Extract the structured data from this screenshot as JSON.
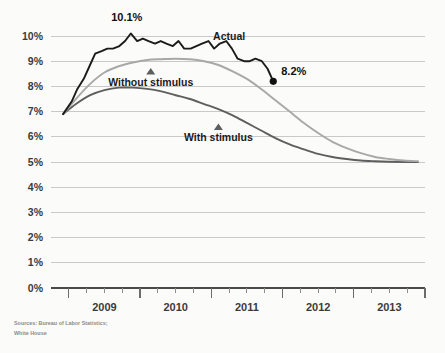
{
  "chart_data": {
    "type": "line",
    "title": "",
    "subtitle": "",
    "xlabel": "",
    "ylabel": "",
    "ylim": [
      0,
      10.5
    ],
    "xlim": [
      2008.75,
      2014.0
    ],
    "grid": true,
    "legend_position": "inline-annotations",
    "ytick_labels": [
      "0%",
      "1%",
      "2%",
      "3%",
      "4%",
      "5%",
      "6%",
      "7%",
      "8%",
      "9%",
      "10%"
    ],
    "ytick_values": [
      0,
      1,
      2,
      3,
      4,
      5,
      6,
      7,
      8,
      9,
      10
    ],
    "xtick_labels": [
      "2009",
      "2010",
      "2011",
      "2012",
      "2013"
    ],
    "xtick_values": [
      2009.5,
      2010.5,
      2011.5,
      2012.5,
      2013.5
    ],
    "x_minor_ticks_per_year": 4,
    "series": [
      {
        "name": "Actual",
        "color": "#1b1b1b",
        "x": [
          2008.92,
          2009.04,
          2009.12,
          2009.21,
          2009.29,
          2009.37,
          2009.46,
          2009.54,
          2009.62,
          2009.71,
          2009.79,
          2009.87,
          2009.96,
          2010.04,
          2010.12,
          2010.21,
          2010.29,
          2010.37,
          2010.46,
          2010.54,
          2010.62,
          2010.71,
          2010.79,
          2010.87,
          2010.96,
          2011.04,
          2011.12,
          2011.21,
          2011.29,
          2011.37,
          2011.46,
          2011.54,
          2011.62,
          2011.71,
          2011.79,
          2011.87
        ],
        "values": [
          6.9,
          7.4,
          7.9,
          8.3,
          8.8,
          9.3,
          9.4,
          9.5,
          9.5,
          9.6,
          9.8,
          10.1,
          9.8,
          9.9,
          9.8,
          9.7,
          9.8,
          9.7,
          9.6,
          9.8,
          9.5,
          9.5,
          9.6,
          9.7,
          9.8,
          9.5,
          9.7,
          9.8,
          9.5,
          9.1,
          9.0,
          9.0,
          9.1,
          9.0,
          8.7,
          8.2
        ]
      },
      {
        "name": "Without stimulus",
        "color": "#a8a8a8",
        "x": [
          2008.92,
          2009.1,
          2009.3,
          2009.5,
          2009.7,
          2009.9,
          2010.1,
          2010.3,
          2010.5,
          2010.7,
          2010.9,
          2011.1,
          2011.3,
          2011.5,
          2011.7,
          2011.9,
          2012.1,
          2012.3,
          2012.5,
          2012.7,
          2012.9,
          2013.1,
          2013.3,
          2013.5,
          2013.7,
          2013.9
        ],
        "values": [
          6.9,
          7.5,
          8.1,
          8.55,
          8.8,
          8.95,
          9.05,
          9.08,
          9.1,
          9.08,
          9.0,
          8.85,
          8.6,
          8.3,
          7.9,
          7.45,
          7.0,
          6.55,
          6.15,
          5.8,
          5.55,
          5.35,
          5.2,
          5.12,
          5.06,
          5.03
        ]
      },
      {
        "name": "With stimulus",
        "color": "#5e5e5e",
        "x": [
          2008.92,
          2009.1,
          2009.3,
          2009.5,
          2009.7,
          2009.9,
          2010.1,
          2010.3,
          2010.5,
          2010.7,
          2010.9,
          2011.1,
          2011.3,
          2011.5,
          2011.7,
          2011.9,
          2012.1,
          2012.3,
          2012.5,
          2012.7,
          2012.9,
          2013.1,
          2013.3,
          2013.5,
          2013.7,
          2013.9
        ],
        "values": [
          6.9,
          7.3,
          7.65,
          7.85,
          7.95,
          7.95,
          7.9,
          7.8,
          7.65,
          7.5,
          7.3,
          7.1,
          6.85,
          6.55,
          6.25,
          5.95,
          5.7,
          5.5,
          5.32,
          5.2,
          5.12,
          5.06,
          5.03,
          5.01,
          5.0,
          5.0
        ]
      }
    ],
    "annotations": [
      {
        "id": "peak-label",
        "text": "10.1%",
        "x": 2009.87,
        "y": 10.1,
        "series": "Actual"
      },
      {
        "id": "endpoint-label",
        "text": "8.2%",
        "x": 2011.87,
        "y": 8.2,
        "series": "Actual",
        "marker": "dot"
      },
      {
        "id": "actual-label",
        "text": "Actual",
        "x": 2011.25,
        "y": 9.85,
        "series": "Actual"
      },
      {
        "id": "without-label",
        "text": "Without stimulus",
        "x": 2010.15,
        "y": 8.55,
        "series": "Without stimulus",
        "marker": "triangle"
      },
      {
        "id": "with-label",
        "text": "With stimulus",
        "x": 2011.1,
        "y": 6.35,
        "series": "With stimulus",
        "marker": "triangle"
      }
    ],
    "source": "Sources: Bureau of Labor Statistics;",
    "source_line2": "White House"
  },
  "colors": {
    "background": "#fbfbfa",
    "gridline": "#c9c9c9",
    "axis": "#4a4a4a",
    "actual": "#1b1b1b",
    "without_stimulus": "#a8a8a8",
    "with_stimulus": "#5e5e5e",
    "text": "#3b3b3b",
    "source_text": "#8a8a8a"
  }
}
